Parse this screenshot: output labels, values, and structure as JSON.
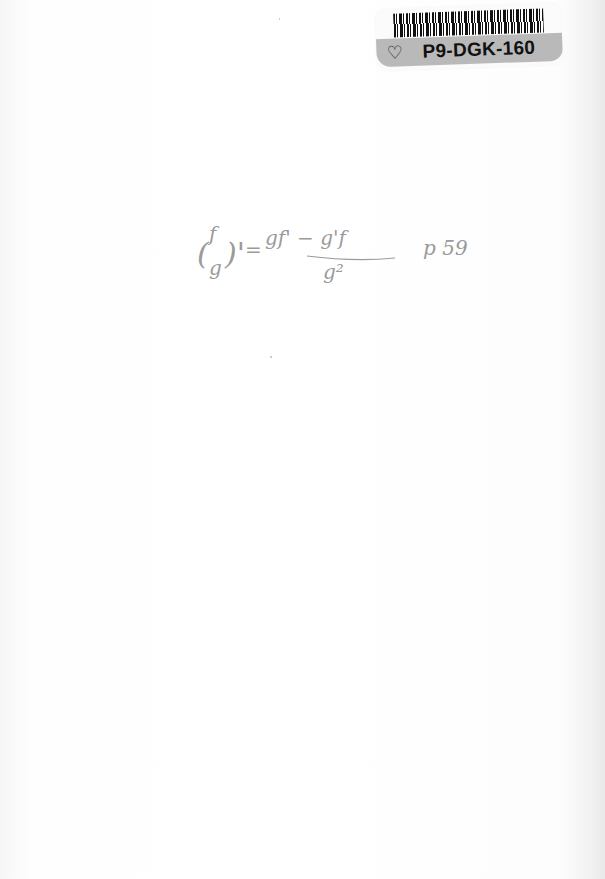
{
  "sticker": {
    "code": "P9-DGK-160",
    "icon": "leaf-outline-icon",
    "icon_glyph": "♡"
  },
  "handwriting": {
    "lhs": "(f/g)'",
    "equals": "=",
    "numerator": "gf' − g'f",
    "denominator": "g²",
    "page_ref": "p 59",
    "color": "#9a9a9a"
  }
}
